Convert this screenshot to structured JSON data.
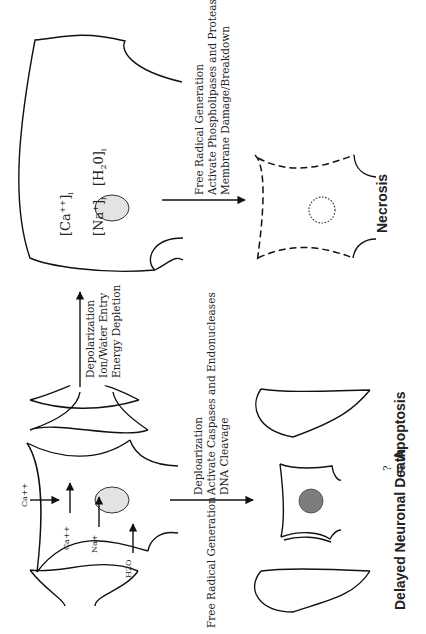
{
  "diagram": {
    "orientation": "rotated 90 degrees counter-clockwise",
    "initial_state": {
      "ions": [
        "Ca++",
        "Ca++",
        "Na+",
        "H2O"
      ]
    },
    "swollen_neuron": {
      "labels": {
        "ca": "[Ca",
        "ca_sup": "++",
        "ca_end": "]",
        "ca_sub": "i",
        "na": "[Na",
        "na_sup": "+",
        "na_end": "]",
        "na_sub": "i",
        "h2o": "[H",
        "h2o_sub2": "2",
        "h2o_end": "0]",
        "h2o_sub": "i"
      }
    },
    "arrow_to_swollen": {
      "lines": [
        "Depolarization",
        "Ion/Water Entry",
        "Energy Depletion"
      ]
    },
    "arrow_to_necrosis": {
      "lines": [
        "Free Radical Generation",
        "Activate Phospholipases and Proteases",
        "Membrane Damage/Breakdown"
      ]
    },
    "arrow_to_apoptosis": {
      "lines": [
        "Free Radical Generation",
        "Deploarization",
        "Activate Caspases and Endonucleases",
        "DNA Cleavage"
      ]
    },
    "outcomes": {
      "necrosis": "Necrosis",
      "apoptosis_left": "Delayed Neuronal Death",
      "apoptosis_q": "?",
      "apoptosis_eq": "=",
      "apoptosis_right": "Apoptosis"
    },
    "colors": {
      "stroke": "#111111",
      "nucleus_light": "#e3e3e3",
      "nucleus_dark": "#7d7d7d",
      "background": "#ffffff"
    }
  }
}
